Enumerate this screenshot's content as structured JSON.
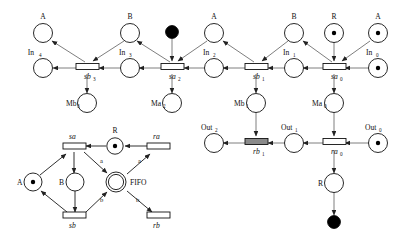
{
  "figure": {
    "background": "#ffffff",
    "stroke_color": "#111111",
    "arc_color": "#6f6f6f",
    "shaded_transition_color": "#8a8a8a"
  },
  "top_net": {
    "name": "unfolded-fifo-net",
    "places": [
      {
        "id": "A4",
        "label": "A",
        "sub": "",
        "tokens": 0,
        "x": 43,
        "y": 33
      },
      {
        "id": "In4",
        "label": "In",
        "sub": "4",
        "tokens": 0,
        "x": 43,
        "y": 68
      },
      {
        "id": "Mb3",
        "label": "Mb",
        "sub": "3",
        "tokens": 0,
        "x": 87,
        "y": 103
      },
      {
        "id": "B3",
        "label": "B",
        "sub": "",
        "tokens": 0,
        "x": 130,
        "y": 33
      },
      {
        "id": "In3",
        "label": "In",
        "sub": "3",
        "tokens": 0,
        "x": 130,
        "y": 68
      },
      {
        "id": "blk1",
        "label": "",
        "sub": "",
        "tokens": 0,
        "x": 172,
        "y": 32,
        "black": true
      },
      {
        "id": "Ma2",
        "label": "Ma",
        "sub": "2",
        "tokens": 0,
        "x": 172,
        "y": 103
      },
      {
        "id": "A2",
        "label": "A",
        "sub": "",
        "tokens": 0,
        "x": 214,
        "y": 33
      },
      {
        "id": "In2",
        "label": "In",
        "sub": "2",
        "tokens": 0,
        "x": 214,
        "y": 68
      },
      {
        "id": "Mb1",
        "label": "Mb",
        "sub": "1",
        "tokens": 0,
        "x": 256,
        "y": 103
      },
      {
        "id": "B1",
        "label": "B",
        "sub": "",
        "tokens": 0,
        "x": 294,
        "y": 33
      },
      {
        "id": "In1",
        "label": "In",
        "sub": "1",
        "tokens": 0,
        "x": 294,
        "y": 68
      },
      {
        "id": "R0",
        "label": "R",
        "sub": "",
        "tokens": 1,
        "x": 334,
        "y": 33
      },
      {
        "id": "A0",
        "label": "A",
        "sub": "",
        "tokens": 1,
        "x": 378,
        "y": 33
      },
      {
        "id": "In0",
        "label": "In",
        "sub": "0",
        "tokens": 1,
        "x": 378,
        "y": 68
      },
      {
        "id": "Ma0",
        "label": "Ma",
        "sub": "0",
        "tokens": 0,
        "x": 334,
        "y": 103
      }
    ],
    "transitions": [
      {
        "id": "sb3",
        "label": "sb",
        "sub": "3",
        "x": 87,
        "y": 68,
        "shaded": false
      },
      {
        "id": "sa2",
        "label": "sa",
        "sub": "2",
        "x": 172,
        "y": 68,
        "shaded": false
      },
      {
        "id": "sb1",
        "label": "sb",
        "sub": "1",
        "x": 256,
        "y": 68,
        "shaded": false
      },
      {
        "id": "sa0",
        "label": "sa",
        "sub": "0",
        "x": 334,
        "y": 68,
        "shaded": false
      }
    ]
  },
  "bottom_right_net": {
    "name": "unfolded-receive-net",
    "places": [
      {
        "id": "Out2",
        "label": "Out",
        "sub": "2",
        "tokens": 0,
        "x": 214,
        "y": 143
      },
      {
        "id": "Out1",
        "label": "Out",
        "sub": "1",
        "tokens": 0,
        "x": 294,
        "y": 143
      },
      {
        "id": "Out0",
        "label": "Out",
        "sub": "0",
        "tokens": 1,
        "x": 378,
        "y": 143
      },
      {
        "id": "Rb",
        "label": "R",
        "sub": "",
        "tokens": 0,
        "x": 334,
        "y": 183
      },
      {
        "id": "blk2",
        "label": "",
        "sub": "",
        "tokens": 0,
        "x": 334,
        "y": 222,
        "black": true
      }
    ],
    "transitions": [
      {
        "id": "rb1",
        "label": "rb",
        "sub": "1",
        "x": 256,
        "y": 143,
        "shaded": true
      },
      {
        "id": "ra0",
        "label": "ra",
        "sub": "0",
        "x": 334,
        "y": 143,
        "shaded": false
      }
    ]
  },
  "folded_net": {
    "name": "folded-fifo-net",
    "places": [
      {
        "id": "fA",
        "label": "A",
        "sub": "",
        "tokens": 1,
        "x": 33,
        "y": 182
      },
      {
        "id": "fB",
        "label": "B",
        "sub": "",
        "tokens": 0,
        "x": 75,
        "y": 182
      },
      {
        "id": "fR",
        "label": "R",
        "sub": "",
        "tokens": 1,
        "x": 115,
        "y": 146
      },
      {
        "id": "fFIFO",
        "label": "FIFO",
        "sub": "",
        "tokens": 0,
        "x": 116,
        "y": 182,
        "double": true
      }
    ],
    "transitions": [
      {
        "id": "fsa",
        "label": "sa",
        "sub": "",
        "x": 74,
        "y": 146
      },
      {
        "id": "fra",
        "label": "ra",
        "sub": "",
        "x": 158,
        "y": 146
      },
      {
        "id": "fsb",
        "label": "sb",
        "sub": "",
        "x": 74,
        "y": 218
      },
      {
        "id": "frb",
        "label": "rb",
        "sub": "",
        "x": 158,
        "y": 218
      }
    ],
    "arc_labels": [
      {
        "text": "a",
        "x": 100,
        "y": 163
      },
      {
        "text": "a",
        "x": 138,
        "y": 163
      },
      {
        "text": "b",
        "x": 100,
        "y": 202
      },
      {
        "text": "b",
        "x": 136,
        "y": 202
      }
    ]
  }
}
